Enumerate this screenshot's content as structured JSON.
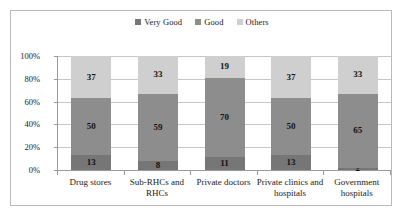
{
  "chart_data": {
    "type": "bar",
    "subtype": "100% stacked column",
    "title": "",
    "subtitle": "",
    "xlabel": "",
    "ylabel": "",
    "ylim": [
      0,
      100
    ],
    "ytick_labels": [
      "0%",
      "20%",
      "40%",
      "60%",
      "80%",
      "100%"
    ],
    "ytick_values": [
      0,
      20,
      40,
      60,
      80,
      100
    ],
    "grid": true,
    "legend_position": "top-center",
    "categories": [
      "Drug stores",
      "Sub-RHCs and RHCs",
      "Private doctors",
      "Private clinics and hospitals",
      "Government hospitals"
    ],
    "series": [
      {
        "name": "Very Good",
        "color": "#767676",
        "values": [
          13,
          8,
          11,
          13,
          2
        ]
      },
      {
        "name": "Good",
        "color": "#8d8d8d",
        "values": [
          50,
          59,
          70,
          50,
          65
        ]
      },
      {
        "name": "Others",
        "color": "#cfcfcf",
        "values": [
          37,
          33,
          19,
          37,
          33
        ]
      }
    ]
  },
  "legend": {
    "items": [
      {
        "label": "Very Good",
        "color": "#767676"
      },
      {
        "label": "Good",
        "color": "#8d8d8d"
      },
      {
        "label": "Others",
        "color": "#cfcfcf"
      }
    ]
  },
  "axes": {
    "y_ticks": [
      "100%",
      "80%",
      "60%",
      "40%",
      "20%",
      "0%"
    ],
    "x_labels": [
      "Drug stores",
      "Sub-RHCs and RHCs",
      "Private doctors",
      "Private clinics and hospitals",
      "Government hospitals"
    ]
  }
}
